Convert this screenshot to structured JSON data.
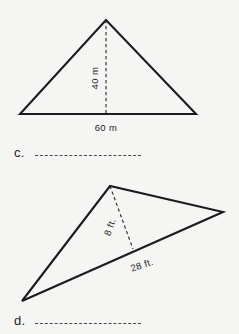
{
  "page": {
    "background_color": "#f5f5f4",
    "ink_color": "#1c1c1c"
  },
  "problems": [
    {
      "letter": "c.",
      "figure": {
        "shape": "triangle",
        "kind": "isosceles-upright",
        "vertices": [
          [
            20,
            114
          ],
          [
            106,
            20
          ],
          [
            196,
            114
          ]
        ],
        "altitude": {
          "from": [
            106,
            20
          ],
          "to": [
            106,
            114
          ],
          "style": "dashed"
        },
        "labels": [
          {
            "name": "height-label",
            "text": "40 m",
            "value": 40,
            "unit": "m",
            "rotation": -90,
            "x": 98,
            "y": 78
          },
          {
            "name": "base-label",
            "text": "60 m",
            "value": 60,
            "unit": "m",
            "rotation": 0,
            "x": 89,
            "y": 129
          }
        ]
      },
      "answer_blank": ""
    },
    {
      "letter": "d.",
      "figure": {
        "shape": "triangle",
        "kind": "scalene-oblique",
        "vertices": [
          [
            22,
            301
          ],
          [
            110,
            186
          ],
          [
            223,
            212
          ]
        ],
        "altitude": {
          "from": [
            110,
            186
          ],
          "to": [
            133,
            249
          ],
          "style": "dashed"
        },
        "labels": [
          {
            "name": "height-label",
            "text": "8 ft.",
            "value": 8,
            "unit": "ft.",
            "rotation": -70,
            "x": 113,
            "y": 228
          },
          {
            "name": "base-label",
            "text": "28 ft.",
            "value": 28,
            "unit": "ft.",
            "rotation": -19,
            "x": 126,
            "y": 266
          }
        ]
      },
      "answer_blank": ""
    }
  ]
}
